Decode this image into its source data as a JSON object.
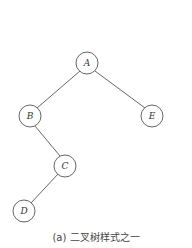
{
  "diagram": {
    "type": "binary-tree",
    "nodes": [
      {
        "id": "A",
        "label": "A",
        "x": 87,
        "y": 63
      },
      {
        "id": "B",
        "label": "B",
        "x": 30,
        "y": 116
      },
      {
        "id": "E",
        "label": "E",
        "x": 152,
        "y": 116
      },
      {
        "id": "C",
        "label": "C",
        "x": 65,
        "y": 166
      },
      {
        "id": "D",
        "label": "D",
        "x": 24,
        "y": 211
      }
    ],
    "edges": [
      {
        "from": "A",
        "to": "B"
      },
      {
        "from": "A",
        "to": "E"
      },
      {
        "from": "B",
        "to": "C"
      },
      {
        "from": "C",
        "to": "D"
      }
    ]
  },
  "caption": "(a) 二叉树样式之一"
}
